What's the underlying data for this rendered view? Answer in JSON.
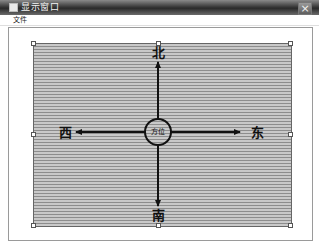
{
  "window": {
    "title": "显示窗口",
    "close_label": "×"
  },
  "menubar": {
    "items": [
      {
        "label": "文件"
      }
    ]
  },
  "canvas": {
    "background": "horizontal gray stripes",
    "selection_handles": 8
  },
  "compass": {
    "center_label": "方位",
    "north": "北",
    "south": "南",
    "west": "西",
    "east": "东"
  },
  "colors": {
    "titlebar_dark": "#2a2a2a",
    "stripe_light": "#c9c9c9",
    "stripe_dark": "#8d8d8d",
    "arrow": "#111111"
  }
}
